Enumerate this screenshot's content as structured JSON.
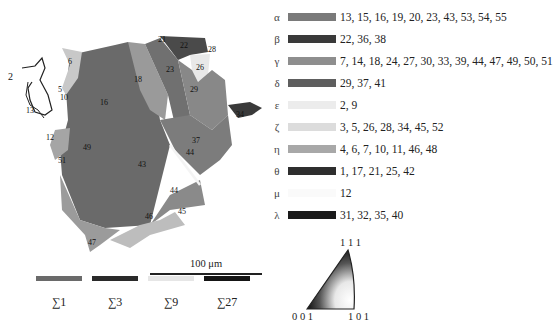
{
  "figure": {
    "map_grain_labels": [
      "1",
      "2",
      "5",
      "6",
      "10",
      "12",
      "13",
      "16",
      "17",
      "18",
      "21",
      "22",
      "23",
      "25",
      "26",
      "28",
      "29",
      "31",
      "32",
      "34",
      "37",
      "41",
      "42",
      "43",
      "44",
      "45",
      "46",
      "47",
      "49",
      "50",
      "51",
      "55"
    ],
    "scale_bar_label": "100 μm"
  },
  "legend": [
    {
      "symbol": "α",
      "color": "#7a7a7a",
      "values": "13, 15, 16, 19, 20, 23, 43, 53, 54, 55"
    },
    {
      "symbol": "β",
      "color": "#3a3a3a",
      "values": "22, 36, 38"
    },
    {
      "symbol": "γ",
      "color": "#8e8e8e",
      "values": "7, 14, 18, 24, 27, 30, 33, 39, 44, 47, 49, 50, 51"
    },
    {
      "symbol": "δ",
      "color": "#5e5e5e",
      "values": "29, 37, 41"
    },
    {
      "symbol": "ε",
      "color": "#ececec",
      "values": "2, 9"
    },
    {
      "symbol": "ζ",
      "color": "#d8d8d8",
      "values": "3, 5, 26, 28, 34, 45, 52"
    },
    {
      "symbol": "η",
      "color": "#a8a8a8",
      "values": "4, 6, 7, 10, 11, 46, 48"
    },
    {
      "symbol": "θ",
      "color": "#2e2e2e",
      "values": "1, 17, 21, 25, 42"
    },
    {
      "symbol": "μ",
      "color": "#ffffff",
      "values": "12"
    },
    {
      "symbol": "λ",
      "color": "#1a1a1a",
      "values": "31, 32, 35, 40"
    }
  ],
  "boundaries": [
    {
      "label": "∑1",
      "color": "#6a6a6a"
    },
    {
      "label": "∑3",
      "color": "#2a2a2a"
    },
    {
      "label": "∑9",
      "color": "#e6e6e6"
    },
    {
      "label": "∑27",
      "color": "#151515"
    }
  ],
  "ipf": {
    "top": "1 1 1",
    "left": "0 0 1",
    "right": "1 0 1"
  }
}
